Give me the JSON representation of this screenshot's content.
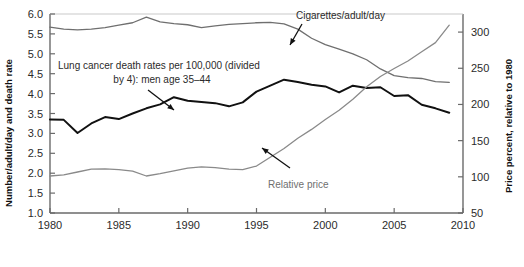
{
  "chart_data": {
    "type": "line",
    "title": "",
    "xlabel": "",
    "ylabel": "Number/adult/day and death rate",
    "y2label": "Price percent, relative to 1980",
    "xlim": [
      1980,
      2010
    ],
    "ylim": [
      1.0,
      6.0
    ],
    "y2lim": [
      50,
      325
    ],
    "grid": false,
    "legend_position": "inline-annotations",
    "xticks": [
      "1980",
      "1985",
      "1990",
      "1995",
      "2000",
      "2005",
      "2010"
    ],
    "xtick_values": [
      1980,
      1985,
      1990,
      1995,
      2000,
      2005,
      2010
    ],
    "yticks": [
      "1.0",
      "1.5",
      "2.0",
      "2.5",
      "3.0",
      "3.5",
      "4.0",
      "4.5",
      "5.0",
      "5.5",
      "6.0"
    ],
    "ytick_values": [
      1.0,
      1.5,
      2.0,
      2.5,
      3.0,
      3.5,
      4.0,
      4.5,
      5.0,
      5.5,
      6.0
    ],
    "y2ticks": [
      "50",
      "100",
      "150",
      "200",
      "250",
      "300"
    ],
    "y2tick_values": [
      50,
      100,
      150,
      200,
      250,
      300
    ],
    "x": [
      1980,
      1981,
      1982,
      1983,
      1984,
      1985,
      1986,
      1987,
      1988,
      1989,
      1990,
      1991,
      1992,
      1993,
      1994,
      1995,
      1996,
      1997,
      1998,
      1999,
      2000,
      2001,
      2002,
      2003,
      2004,
      2005,
      2006,
      2007,
      2008,
      2009
    ],
    "series": [
      {
        "name": "Cigarettes/adult/day",
        "color": "#6f6f6f",
        "axis": "left",
        "values": [
          5.67,
          5.62,
          5.6,
          5.62,
          5.66,
          5.72,
          5.78,
          5.92,
          5.8,
          5.76,
          5.73,
          5.66,
          5.7,
          5.74,
          5.76,
          5.78,
          5.79,
          5.75,
          5.62,
          5.39,
          5.23,
          5.12,
          5.0,
          4.85,
          4.62,
          4.45,
          4.4,
          4.38,
          4.3,
          4.28
        ]
      },
      {
        "name": "Lung cancer death rates per 100,000 (divided by 4): men age 35-44",
        "color": "#111111",
        "axis": "left",
        "values": [
          3.35,
          3.34,
          3.01,
          3.25,
          3.41,
          3.36,
          3.5,
          3.63,
          3.73,
          3.91,
          3.82,
          3.79,
          3.76,
          3.68,
          3.78,
          4.05,
          4.2,
          4.35,
          4.29,
          4.22,
          4.18,
          4.03,
          4.2,
          4.14,
          4.16,
          3.94,
          3.96,
          3.72,
          3.63,
          3.52
        ]
      },
      {
        "name": "Relative price",
        "color": "#8a8a8a",
        "axis": "left",
        "values": [
          1.93,
          1.96,
          2.03,
          2.1,
          2.11,
          2.09,
          2.05,
          1.93,
          1.99,
          2.06,
          2.13,
          2.16,
          2.14,
          2.1,
          2.09,
          2.18,
          2.4,
          2.62,
          2.88,
          3.1,
          3.35,
          3.58,
          3.86,
          4.17,
          4.43,
          4.63,
          4.82,
          5.05,
          5.28,
          5.72
        ]
      }
    ],
    "series_right_axis_equivalent": {
      "Relative price_percent": [
        96,
        98,
        102,
        105,
        106,
        104,
        102,
        96,
        99,
        103,
        106,
        108,
        107,
        105,
        104,
        109,
        120,
        131,
        144,
        155,
        167,
        179,
        193,
        208,
        221,
        231,
        241,
        252,
        264,
        286
      ]
    },
    "annotations": [
      {
        "id": "cigarettes-label",
        "text": "Cigarettes/adult/day",
        "color": "#2b2b2b"
      },
      {
        "id": "lung-cancer-label-line1",
        "text": "Lung cancer death rates per 100,000 (divided",
        "color": "#2b2b2b"
      },
      {
        "id": "lung-cancer-label-line2",
        "text": "by 4): men age 35–44",
        "color": "#2b2b2b"
      },
      {
        "id": "relative-price-label",
        "text": "Relative price",
        "color": "#6f6f6f"
      }
    ],
    "colors": {
      "cigarettes": "#6f6f6f",
      "lung_cancer": "#111111",
      "relative_price": "#8a8a8a",
      "axis": "#6a6a6a",
      "text": "#1a1a1a",
      "background": "#ffffff"
    }
  }
}
